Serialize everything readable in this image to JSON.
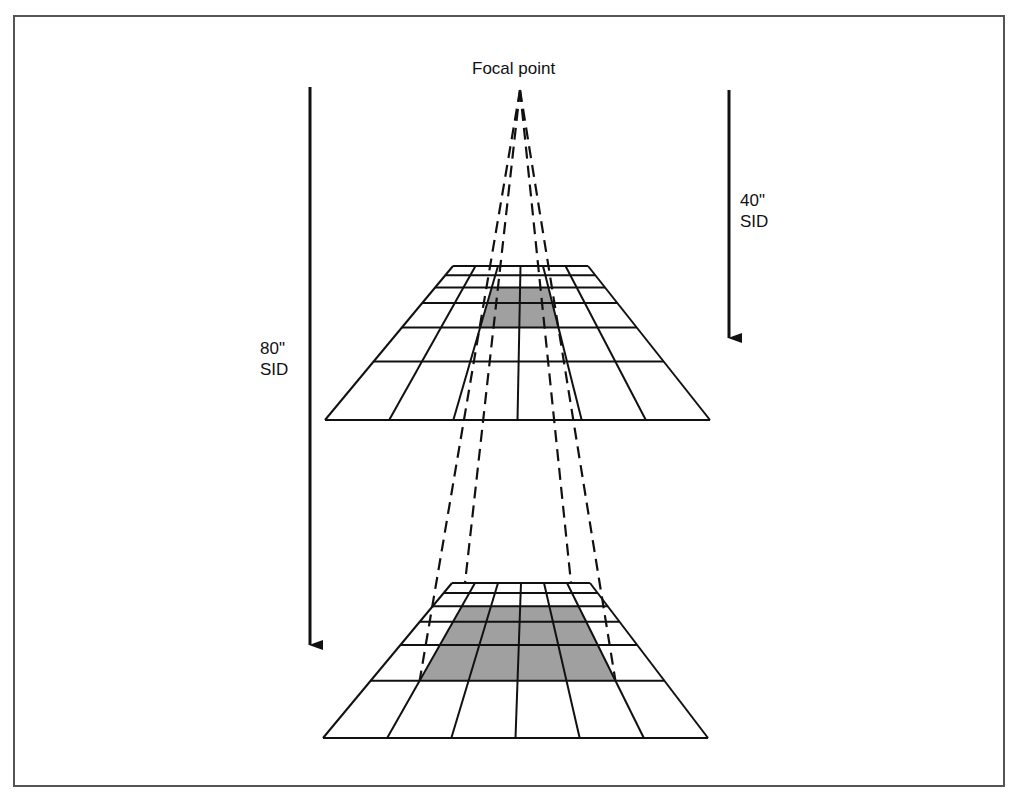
{
  "diagram": {
    "labels": {
      "focal_point": "Focal point",
      "sid_40": {
        "line1": "40\"",
        "line2": "SID"
      },
      "sid_80": {
        "line1": "80\"",
        "line2": "SID"
      }
    },
    "focal_point": {
      "x": 520,
      "y": 90
    },
    "arrows": [
      {
        "name": "arrow-80-sid",
        "x": 310,
        "y_start": 87,
        "y_end": 645
      },
      {
        "name": "arrow-40-sid",
        "x": 729,
        "y_start": 90,
        "y_end": 338
      }
    ],
    "grids": [
      {
        "name": "grid-40-sid",
        "top_y": 266,
        "bottom_y": 420,
        "top_left_x": 453,
        "top_right_x": 588,
        "bottom_left_x": 325,
        "bottom_right_x": 710,
        "columns": 6,
        "row_fracs": [
          0.06,
          0.14,
          0.24,
          0.4,
          0.62
        ],
        "shaded": {
          "col_start": 2,
          "col_end": 4,
          "row_start": 2,
          "row_end": 4
        }
      },
      {
        "name": "grid-80-sid",
        "top_y": 583,
        "bottom_y": 738,
        "top_left_x": 452,
        "top_right_x": 590,
        "bottom_left_x": 323,
        "bottom_right_x": 708,
        "columns": 6,
        "row_fracs": [
          0.065,
          0.15,
          0.25,
          0.4,
          0.63
        ],
        "shaded": {
          "col_start": 1,
          "col_end": 5,
          "row_start": 2,
          "row_end": 5
        }
      }
    ],
    "colors": {
      "line": "#111111",
      "shade": "#a0a0a0",
      "frame": "#555555",
      "background": "#ffffff"
    }
  }
}
